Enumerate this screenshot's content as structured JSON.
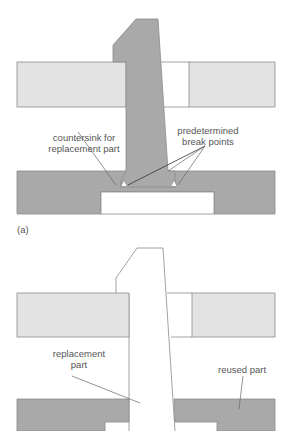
{
  "figure": {
    "panel_a": {
      "label": "(a)",
      "annotations": {
        "countersink_line1": "countersink for",
        "countersink_line2": "replacement part",
        "break_line1": "predetermined",
        "break_line2": "break points"
      }
    },
    "panel_b": {
      "annotations": {
        "replacement_line1": "replacement",
        "replacement_line2": "part",
        "reused": "reused part"
      }
    },
    "colors": {
      "plate_light": "#e3e3e3",
      "part_dark": "#a9a9a9",
      "outline": "#8c8c8c",
      "leader": "#666666"
    }
  }
}
